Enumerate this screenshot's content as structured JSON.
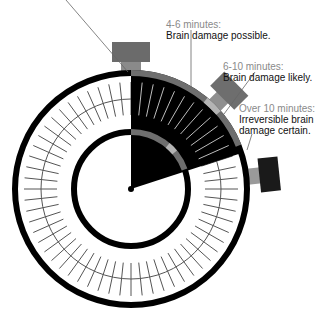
{
  "diagram": {
    "type": "stopwatch-timeline",
    "center": [
      131,
      189
    ],
    "colors": {
      "ring": "#000000",
      "wedge": "#000000",
      "arc_dark": "#6e6e6e",
      "arc_light": "#b4b4b4",
      "tick": "#555555",
      "crown": "#6b6b6b",
      "button_dark": "#1a1a1a",
      "label_time": "#8a8a8a",
      "label_desc": "#111111"
    },
    "callouts": [
      {
        "id": "top-cut",
        "time": "",
        "desc": ""
      },
      {
        "id": "4-6",
        "time": "4-6 minutes:",
        "desc": "Brain damage possible."
      },
      {
        "id": "6-10",
        "time": "6-10 minutes:",
        "desc": "Brain damage likely."
      },
      {
        "id": "over-10",
        "time": "Over 10 minutes:",
        "desc_lines": [
          "Irreversible brain",
          "damage certain."
        ]
      }
    ]
  }
}
